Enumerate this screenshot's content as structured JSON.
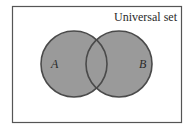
{
  "diagram": {
    "type": "venn",
    "universe_label": "Universal set",
    "sets": [
      {
        "name": "A",
        "cx": 74,
        "cy": 64,
        "r": 33
      },
      {
        "name": "B",
        "cx": 119,
        "cy": 64,
        "r": 33
      }
    ],
    "colors": {
      "fill": "#9a9a9a",
      "stroke": "#4a4a4a",
      "border": "#555555",
      "background": "#ffffff"
    }
  }
}
